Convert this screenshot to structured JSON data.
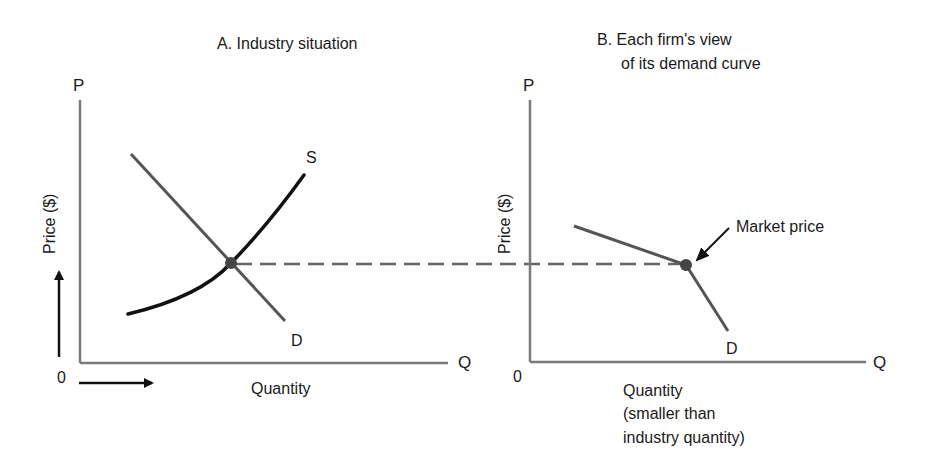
{
  "panel_a": {
    "title": "A. Industry situation",
    "y_axis_letter": "P",
    "x_axis_letter": "Q",
    "origin": "0",
    "y_label": "Price ($)",
    "x_label": "Quantity",
    "supply_label": "S",
    "demand_label": "D"
  },
  "panel_b": {
    "title_line1": "B. Each firm's view",
    "title_line2": "of its demand curve",
    "y_axis_letter": "P",
    "x_axis_letter": "Q",
    "origin": "0",
    "y_label": "Price ($)",
    "x_label_line1": "Quantity",
    "x_label_line2": "(smaller than",
    "x_label_line3": "industry quantity)",
    "demand_label": "D",
    "annotation": "Market price"
  },
  "colors": {
    "axis": "#7a7a7a",
    "demand": "#555555",
    "supply": "#111111",
    "dashed": "#666666",
    "point": "#444444",
    "text": "#1a1a1a"
  }
}
